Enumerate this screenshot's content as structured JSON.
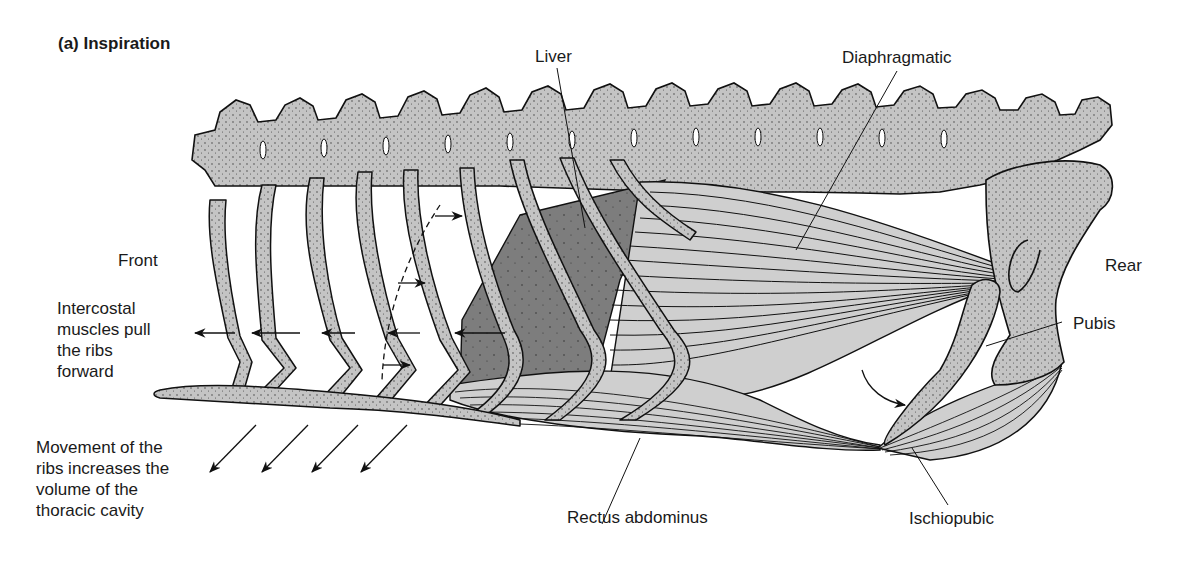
{
  "figure": {
    "title": "(a) Inspiration",
    "labels": {
      "liver": "Liver",
      "diaphragmatic": "Diaphragmatic",
      "front": "Front",
      "rear": "Rear",
      "pubis": "Pubis",
      "intercostal": "Intercostal\nmuscles pull\nthe ribs\nforward",
      "movement": "Movement of the\nribs increases the\nvolume of the\nthoracic cavity",
      "rectus": "Rectus abdominus",
      "ischiopubic": "Ischiopubic"
    },
    "colors": {
      "bone": "#c4c4c4",
      "liver": "#7d7d7d",
      "outline": "#111111",
      "muscle_fill": "#cfcfcf",
      "background": "#ffffff"
    },
    "counts": {
      "vertebrae": 17,
      "rib_forward_arrows": 5,
      "volume_arrows": 4
    }
  }
}
